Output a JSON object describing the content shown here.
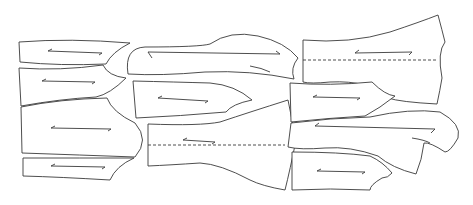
{
  "diagram": {
    "type": "sewing-pattern-marker-layout",
    "background": "#ffffff",
    "line_color": "#3a3a3a",
    "piece_count": 13,
    "pieces": [
      {
        "id": "p1",
        "label": "left-top-strip",
        "grainline": true,
        "fold_line": false
      },
      {
        "id": "p2",
        "label": "left-second",
        "grainline": true,
        "fold_line": false
      },
      {
        "id": "p3",
        "label": "left-large",
        "grainline": true,
        "fold_line": false
      },
      {
        "id": "p4",
        "label": "left-bottom-strip",
        "grainline": true,
        "fold_line": false
      },
      {
        "id": "p5",
        "label": "center-sleeve-top",
        "grainline": true,
        "fold_line": false
      },
      {
        "id": "p6",
        "label": "center-middle",
        "grainline": true,
        "fold_line": false
      },
      {
        "id": "p7",
        "label": "center-back-fold",
        "grainline": true,
        "fold_line": true
      },
      {
        "id": "p8",
        "label": "right-back-fold",
        "grainline": true,
        "fold_line": true
      },
      {
        "id": "p9",
        "label": "right-second",
        "grainline": true,
        "fold_line": false
      },
      {
        "id": "p10",
        "label": "right-sleeve",
        "grainline": true,
        "fold_line": false
      },
      {
        "id": "p11",
        "label": "right-bottom",
        "grainline": true,
        "fold_line": false
      }
    ]
  }
}
